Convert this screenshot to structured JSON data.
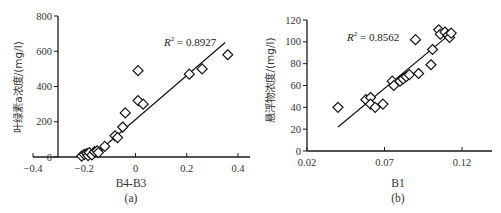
{
  "chart_data": [
    {
      "type": "scatter",
      "panel_label": "(a)",
      "xlabel": "B4-B3",
      "ylabel": "叶绿素a浓度/(mg/l)",
      "xlim": [
        -0.4,
        0.4
      ],
      "ylim": [
        0,
        800
      ],
      "xticks": [
        "-0.4",
        "-0.2",
        "0",
        "0.2",
        "0.4"
      ],
      "yticks": [
        "0",
        "200",
        "400",
        "600",
        "800"
      ],
      "annotation": "R² = 0.8927",
      "r2": 0.8927,
      "trendline": {
        "x": [
          -0.17,
          0.35
        ],
        "y": [
          0,
          650
        ]
      },
      "grid": false,
      "legend": false,
      "points": [
        {
          "x": -0.21,
          "y": 5
        },
        {
          "x": -0.2,
          "y": 15
        },
        {
          "x": -0.19,
          "y": 20
        },
        {
          "x": -0.185,
          "y": 8
        },
        {
          "x": -0.18,
          "y": 25
        },
        {
          "x": -0.17,
          "y": 12
        },
        {
          "x": -0.16,
          "y": 30
        },
        {
          "x": -0.15,
          "y": 35
        },
        {
          "x": -0.145,
          "y": 25
        },
        {
          "x": -0.12,
          "y": 60
        },
        {
          "x": -0.08,
          "y": 120
        },
        {
          "x": -0.07,
          "y": 110
        },
        {
          "x": -0.05,
          "y": 170
        },
        {
          "x": -0.04,
          "y": 250
        },
        {
          "x": 0.01,
          "y": 490
        },
        {
          "x": 0.01,
          "y": 320
        },
        {
          "x": 0.03,
          "y": 300
        },
        {
          "x": 0.21,
          "y": 470
        },
        {
          "x": 0.26,
          "y": 500
        },
        {
          "x": 0.36,
          "y": 580
        }
      ]
    },
    {
      "type": "scatter",
      "panel_label": "(b)",
      "xlabel": "B1",
      "ylabel": "悬浮物浓度/(mg/l)",
      "xlim": [
        0.02,
        0.14
      ],
      "ylim": [
        0,
        120
      ],
      "xticks": [
        "0.02",
        "0.07",
        "0.12"
      ],
      "yticks": [
        "0",
        "20",
        "40",
        "60",
        "80",
        "100",
        "120"
      ],
      "annotation": "R² = 0.8562",
      "r2": 0.8562,
      "trendline": {
        "x": [
          0.04,
          0.113
        ],
        "y": [
          22,
          108
        ]
      },
      "grid": false,
      "legend": false,
      "points": [
        {
          "x": 0.04,
          "y": 40
        },
        {
          "x": 0.058,
          "y": 47
        },
        {
          "x": 0.061,
          "y": 49
        },
        {
          "x": 0.061,
          "y": 43
        },
        {
          "x": 0.064,
          "y": 40
        },
        {
          "x": 0.069,
          "y": 43
        },
        {
          "x": 0.075,
          "y": 64
        },
        {
          "x": 0.076,
          "y": 60
        },
        {
          "x": 0.08,
          "y": 64
        },
        {
          "x": 0.082,
          "y": 66
        },
        {
          "x": 0.084,
          "y": 68
        },
        {
          "x": 0.086,
          "y": 70
        },
        {
          "x": 0.09,
          "y": 102
        },
        {
          "x": 0.092,
          "y": 71
        },
        {
          "x": 0.1,
          "y": 79
        },
        {
          "x": 0.101,
          "y": 93
        },
        {
          "x": 0.105,
          "y": 111
        },
        {
          "x": 0.106,
          "y": 107
        },
        {
          "x": 0.109,
          "y": 109
        },
        {
          "x": 0.111,
          "y": 106
        },
        {
          "x": 0.112,
          "y": 104
        },
        {
          "x": 0.113,
          "y": 108
        }
      ]
    }
  ]
}
